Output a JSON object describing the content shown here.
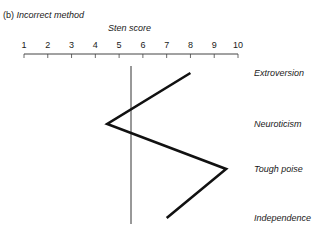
{
  "caption": {
    "tag": "(b)",
    "title": "Incorrect method"
  },
  "chart_data": {
    "type": "line",
    "title": "(b) Incorrect method",
    "xlabel": "Sten score",
    "ylabel": "",
    "xlim": [
      1,
      10
    ],
    "x_ticks": [
      1,
      2,
      3,
      4,
      5,
      6,
      7,
      8,
      9,
      10
    ],
    "orientation": "horizontal-profile",
    "categories": [
      "Extroversion",
      "Neuroticism",
      "Tough poise",
      "Independence"
    ],
    "series": [
      {
        "name": "Profile",
        "values": [
          8.0,
          4.5,
          9.5,
          7.0
        ]
      }
    ],
    "reference_line": {
      "x": 5.5,
      "orientation": "vertical"
    },
    "grid": false,
    "legend": null
  },
  "colors": {
    "line": "#111111",
    "reference": "#333333",
    "axis": "#444444",
    "text": "#1a1a1a"
  }
}
